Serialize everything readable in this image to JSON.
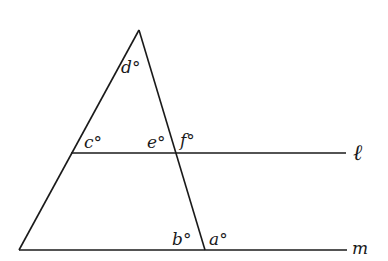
{
  "diagram": {
    "type": "geometry",
    "colors": {
      "stroke": "#1a1a1a",
      "background": "#ffffff"
    },
    "points": {
      "apex": [
        139,
        30
      ],
      "bottom_left": [
        19,
        250
      ],
      "bottom_right": [
        205,
        250
      ],
      "l_left": [
        71,
        153
      ],
      "l_right": [
        183,
        153
      ]
    },
    "lines": {
      "l": {
        "label": "ℓ",
        "y": 153,
        "x_start": 71,
        "x_end": 346
      },
      "m": {
        "label": "m",
        "y": 250,
        "x_start": 19,
        "x_end": 347
      }
    },
    "angle_labels": {
      "a": "a°",
      "b": "b°",
      "c": "c°",
      "d": "d°",
      "e": "e°",
      "f": "f°"
    }
  }
}
